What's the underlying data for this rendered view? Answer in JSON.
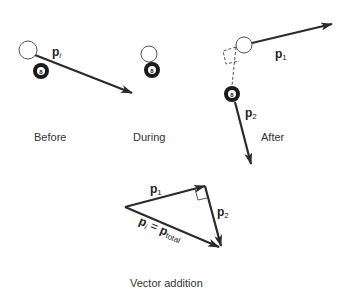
{
  "diagram": {
    "type": "momentum-collision",
    "colors": {
      "ink": "#2b2b2b",
      "ball_fill_dark": "#1a1a1a",
      "cue_ball_fill": "#ffffff",
      "caption": "#333333"
    },
    "panels": {
      "before": {
        "caption": "Before",
        "vector": {
          "symbol": "p",
          "subscript": "i"
        }
      },
      "during": {
        "caption": "During"
      },
      "after": {
        "caption": "After",
        "vector1": {
          "symbol": "p",
          "subscript": "1"
        },
        "vector2": {
          "symbol": "p",
          "subscript": "2"
        }
      },
      "vector_addition": {
        "caption": "Vector addition",
        "p1": {
          "symbol": "p",
          "subscript": "1"
        },
        "p2": {
          "symbol": "p",
          "subscript": "2"
        },
        "resultant": {
          "symbol_a": "p",
          "subscript_a": "i",
          "equals": " = ",
          "symbol_b": "p",
          "subscript_b": "total"
        }
      }
    },
    "ball_number": "8"
  }
}
